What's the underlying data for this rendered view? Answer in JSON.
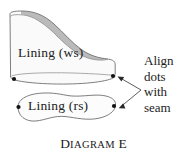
{
  "figure": {
    "caption": {
      "full": "DIAGRAM E",
      "word_initial": "D",
      "word_rest": "IAGRAM",
      "letter_initial": "E"
    },
    "labels": {
      "upper_piece": "Lining (ws)",
      "lower_piece": "Lining (rs)"
    },
    "callout": {
      "lines": [
        "Align",
        "dots",
        "with",
        "seam"
      ],
      "line_1": "Align",
      "line_2": "dots",
      "line_3": "with",
      "line_4": "seam"
    },
    "colors": {
      "outline": "#6b6b6b",
      "fill_light": "#fafafa",
      "fill_shade": "#b6b6b6",
      "dot": "#111111",
      "text": "#222222",
      "background": "#ffffff"
    },
    "markers": {
      "dot_count": 4,
      "dot_positions": [
        {
          "name": "upper-left-dot",
          "x": 14,
          "y": 79
        },
        {
          "name": "upper-right-dot",
          "x": 113,
          "y": 76
        },
        {
          "name": "lower-left-dot",
          "x": 18,
          "y": 107
        },
        {
          "name": "lower-right-dot",
          "x": 114,
          "y": 106
        }
      ]
    },
    "arrows": {
      "count": 2,
      "origin": {
        "x": 141,
        "y": 90
      },
      "targets": [
        {
          "name": "arrow-to-upper-dot",
          "x": 119,
          "y": 78
        },
        {
          "name": "arrow-to-lower-dot",
          "x": 120,
          "y": 107
        }
      ]
    }
  }
}
